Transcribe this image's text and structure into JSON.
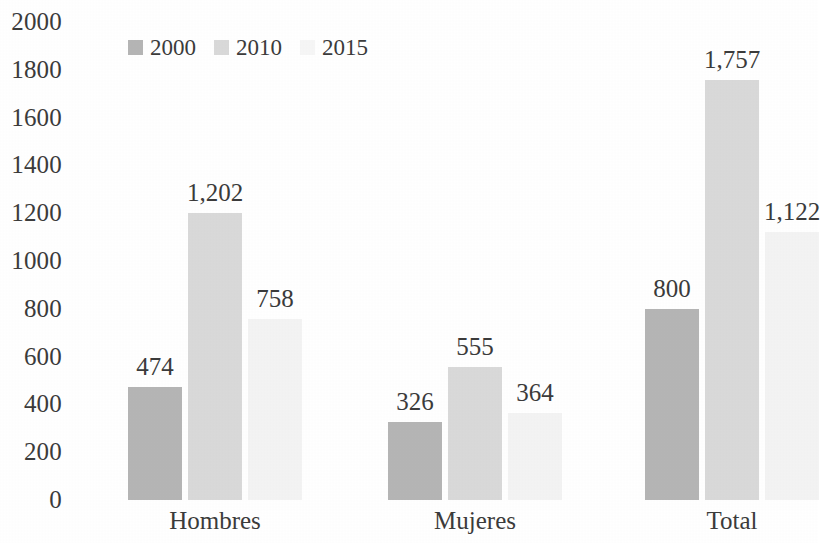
{
  "chart_data": {
    "type": "bar",
    "title": "",
    "subtitle": "",
    "xlabel": "",
    "ylabel": "",
    "categories": [
      "Hombres",
      "Mujeres",
      "Total"
    ],
    "series": [
      {
        "name": "2000",
        "values": [
          474,
          1202,
          800
        ],
        "color": "#b5b5b5"
      },
      {
        "name": "2010",
        "values": [
          1202,
          555,
          1757
        ],
        "color": "#d9d9d9"
      },
      {
        "name": "2015",
        "values": [
          758,
          364,
          1122
        ],
        "color": "#f3f3f3"
      }
    ],
    "grouped_values": {
      "Hombres": {
        "2000": 474,
        "2010": 1202,
        "2015": 758
      },
      "Mujeres": {
        "2000": 326,
        "2010": 555,
        "2015": 364
      },
      "Total": {
        "2000": 800,
        "2010": 1757,
        "2015": 1122
      }
    },
    "data_labels": {
      "Hombres": [
        "474",
        "1,202",
        "758"
      ],
      "Mujeres": [
        "326",
        "555",
        "364"
      ],
      "Total": [
        "800",
        "1,757",
        "1,122"
      ]
    },
    "ylim": [
      0,
      2000
    ],
    "ytick_step": 200,
    "ytick_labels": [
      "2000",
      "1800",
      "1600",
      "1400",
      "1200",
      "1000",
      "800",
      "600",
      "400",
      "200",
      "0"
    ],
    "grid": false,
    "legend_position": "top-left"
  },
  "legend": {
    "items": [
      {
        "label": "2000",
        "color": "#b5b5b5"
      },
      {
        "label": "2010",
        "color": "#d9d9d9"
      },
      {
        "label": "2015",
        "color": "#f6f6f6"
      }
    ]
  },
  "axis": {
    "y_ticks": [
      {
        "label": "2000",
        "value": 2000
      },
      {
        "label": "1800",
        "value": 1800
      },
      {
        "label": "1600",
        "value": 1600
      },
      {
        "label": "1400",
        "value": 1400
      },
      {
        "label": "1200",
        "value": 1200
      },
      {
        "label": "1000",
        "value": 1000
      },
      {
        "label": "800",
        "value": 800
      },
      {
        "label": "600",
        "value": 600
      },
      {
        "label": "400",
        "value": 400
      },
      {
        "label": "200",
        "value": 200
      },
      {
        "label": "0",
        "value": 0
      }
    ]
  },
  "groups": [
    {
      "name": "Hombres",
      "bars": [
        {
          "series": "2000",
          "value": 474,
          "label": "474",
          "color": "#b5b5b5"
        },
        {
          "series": "2010",
          "value": 1202,
          "label": "1,202",
          "color": "#d9d9d9"
        },
        {
          "series": "2015",
          "value": 758,
          "label": "758",
          "color": "#f3f3f3"
        }
      ]
    },
    {
      "name": "Mujeres",
      "bars": [
        {
          "series": "2000",
          "value": 326,
          "label": "326",
          "color": "#b5b5b5"
        },
        {
          "series": "2010",
          "value": 555,
          "label": "555",
          "color": "#d9d9d9"
        },
        {
          "series": "2015",
          "value": 364,
          "label": "364",
          "color": "#f3f3f3"
        }
      ]
    },
    {
      "name": "Total",
      "bars": [
        {
          "series": "2000",
          "value": 800,
          "label": "800",
          "color": "#b5b5b5"
        },
        {
          "series": "2010",
          "value": 1757,
          "label": "1,757",
          "color": "#d9d9d9"
        },
        {
          "series": "2015",
          "value": 1122,
          "label": "1,122",
          "color": "#f3f3f3"
        }
      ]
    }
  ]
}
